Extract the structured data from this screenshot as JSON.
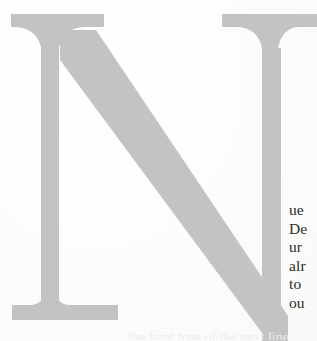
{
  "page": {
    "kind": "book-page-scan-crop",
    "width": 317,
    "height": 341,
    "background_color": "#fdfdfd",
    "ink_color": "#2e2c2a"
  },
  "dropcap": {
    "letter": "N",
    "style": "serif-capital",
    "color": "#c3c3c3",
    "shadow_color": "#bdbdbd",
    "description": "oversized light-grey serif capital N, right stem and diagonal cropped by the page edge"
  },
  "body_text": {
    "note": "right-hand sliver of a text column; each line is cut off by the crop",
    "lines": [
      "ue",
      "De",
      "ur",
      "alr",
      "to",
      "ou"
    ]
  },
  "bleed_text": {
    "line": "the faint tops of the next line"
  }
}
